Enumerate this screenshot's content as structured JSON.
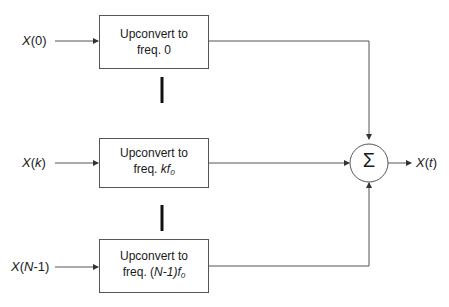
{
  "inputs": [
    {
      "name": "X",
      "arg": "0",
      "arg_italic": false
    },
    {
      "name": "X",
      "arg": "k",
      "arg_italic": true
    },
    {
      "name": "X",
      "arg_prefix": "",
      "arg_var": "N",
      "arg_suffix": "-1"
    }
  ],
  "blocks": [
    {
      "line1": "Upconvert to",
      "line2_prefix": "freq. ",
      "line2_value": "0",
      "line2_sub": ""
    },
    {
      "line1": "Upconvert to",
      "line2_prefix": "freq. ",
      "line2_value": "kf",
      "line2_sub": "0"
    },
    {
      "line1": "Upconvert to",
      "line2_prefix": "freq. (",
      "line2_var": "N",
      "line2_suffix": "-1)f",
      "line2_sub": "0"
    }
  ],
  "summer": {
    "symbol": "Σ"
  },
  "output": {
    "name": "X",
    "arg": "t"
  },
  "colors": {
    "line": "#555555",
    "ellipsis": "#111111"
  }
}
